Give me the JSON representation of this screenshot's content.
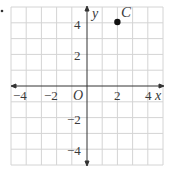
{
  "figure": {
    "bullet": "•",
    "grid": {
      "x_min": -5,
      "x_max": 5,
      "y_min": -5,
      "y_max": 5,
      "step": 1
    },
    "axes": {
      "x_label": "x",
      "y_label": "y",
      "origin_label": "O"
    },
    "x_ticks": [
      {
        "value": -4,
        "label": "−4"
      },
      {
        "value": -2,
        "label": "−2"
      },
      {
        "value": 2,
        "label": "2"
      },
      {
        "value": 4,
        "label": "4"
      }
    ],
    "y_ticks": [
      {
        "value": 4,
        "label": "4"
      },
      {
        "value": 2,
        "label": "2"
      },
      {
        "value": -2,
        "label": "−2"
      },
      {
        "value": -4,
        "label": "−4"
      }
    ],
    "points": [
      {
        "name": "C",
        "x": 2,
        "y": 4
      }
    ],
    "colors": {
      "grid": "#d4d4d4",
      "axis": "#333333",
      "point": "#111111",
      "text": "#3a3a3a"
    }
  }
}
